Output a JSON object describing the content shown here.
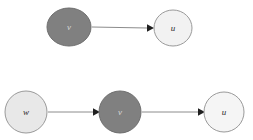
{
  "diagram": {
    "background_color": "#ffffff",
    "rows": [
      {
        "name": "top-row",
        "nodes": [
          {
            "id": "v-top",
            "label": "v",
            "fill": "#808080",
            "stroke": "#6e6e6e",
            "label_color": "#d8d8d8",
            "cx": 69,
            "cy": 27,
            "rx": 22,
            "ry": 19
          },
          {
            "id": "u-top",
            "label": "u",
            "fill": "#f2f2f2",
            "stroke": "#9a9a9a",
            "label_color": "#2b2b2b",
            "cx": 173,
            "cy": 28,
            "rx": 19,
            "ry": 18
          }
        ],
        "edges": [
          {
            "id": "edge-v-u-top",
            "from": "v",
            "to": "u",
            "x1": 92,
            "y1": 27,
            "x2": 152,
            "y2": 28,
            "color": "#8c8c8c"
          }
        ]
      },
      {
        "name": "bottom-row",
        "nodes": [
          {
            "id": "w-bottom",
            "label": "w",
            "fill": "#e8e8e8",
            "stroke": "#9a9a9a",
            "label_color": "#2b2b2b",
            "cx": 26,
            "cy": 112,
            "rx": 21,
            "ry": 21
          },
          {
            "id": "v-bottom",
            "label": "v",
            "fill": "#808080",
            "stroke": "#6e6e6e",
            "label_color": "#d8d8d8",
            "cx": 120,
            "cy": 112,
            "rx": 21,
            "ry": 21
          },
          {
            "id": "u-bottom",
            "label": "u",
            "fill": "#f5f5f5",
            "stroke": "#9a9a9a",
            "label_color": "#2b2b2b",
            "cx": 224,
            "cy": 112,
            "rx": 20,
            "ry": 20
          }
        ],
        "edges": [
          {
            "id": "edge-w-v-bottom",
            "from": "w",
            "to": "v",
            "x1": 48,
            "y1": 112,
            "x2": 98,
            "y2": 112,
            "color": "#8c8c8c"
          },
          {
            "id": "edge-v-u-bottom",
            "from": "v",
            "to": "u",
            "x1": 142,
            "y1": 112,
            "x2": 203,
            "y2": 112,
            "color": "#8c8c8c"
          }
        ]
      }
    ]
  },
  "labels": {
    "v_top": "v",
    "u_top": "u",
    "w_bottom": "w",
    "v_bottom": "v",
    "u_bottom": "u"
  }
}
